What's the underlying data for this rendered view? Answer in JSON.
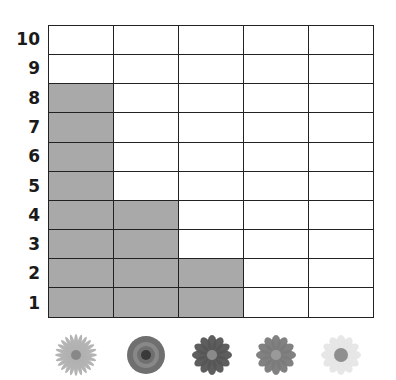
{
  "chart_data": {
    "type": "bar",
    "title": "",
    "xlabel": "",
    "ylabel": "",
    "categories": [
      "Dandelion",
      "Rose",
      "Dark flower",
      "Gerbera",
      "Daisy"
    ],
    "values": [
      8,
      4,
      2,
      0,
      0
    ],
    "ylim": [
      0,
      10
    ],
    "yticks": [
      "1",
      "2",
      "3",
      "4",
      "5",
      "6",
      "7",
      "8",
      "9",
      "10"
    ],
    "grid": true,
    "style": "pictograph grid — filled squares count per flower",
    "fill_color": "#a9a9a9"
  },
  "y_labels": [
    "10",
    "9",
    "8",
    "7",
    "6",
    "5",
    "4",
    "3",
    "2",
    "1"
  ],
  "flowers": [
    {
      "name": "dandelion",
      "shade": "#b0b0b0",
      "center": "#888888"
    },
    {
      "name": "rose",
      "shade": "#6f6f6f",
      "center": "#3a3a3a"
    },
    {
      "name": "dark-flower",
      "shade": "#555555",
      "center": "#8a8a8a"
    },
    {
      "name": "gerbera",
      "shade": "#7a7a7a",
      "center": "#9a9a9a"
    },
    {
      "name": "daisy",
      "shade": "#e6e6e6",
      "center": "#8f8f8f"
    }
  ]
}
